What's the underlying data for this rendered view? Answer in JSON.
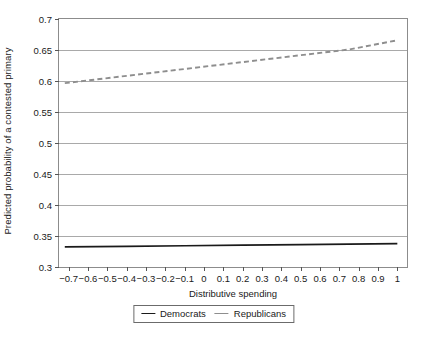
{
  "chart_data": {
    "type": "line",
    "title": "",
    "xlabel": "Distributive spending",
    "ylabel": "Predicted probability of a contested primary",
    "xlim": [
      -0.75,
      1.05
    ],
    "ylim": [
      0.3,
      0.7
    ],
    "xticks": [
      -0.7,
      -0.6,
      -0.5,
      -0.4,
      -0.3,
      -0.2,
      -0.1,
      0,
      0.1,
      0.2,
      0.3,
      0.4,
      0.5,
      0.6,
      0.7,
      0.8,
      0.9,
      1
    ],
    "xticklabels": [
      "−0.7",
      "−0.6",
      "−0.5",
      "−0.4",
      "−0.3",
      "−0.2",
      "−0.1",
      "0",
      "0.1",
      "0.2",
      "0.3",
      "0.4",
      "0.5",
      "0.6",
      "0.7",
      "0.8",
      "0.9",
      "1"
    ],
    "yticks": [
      0.3,
      0.35,
      0.4,
      0.45,
      0.5,
      0.55,
      0.6,
      0.65,
      0.7
    ],
    "yticklabels": [
      "0.3",
      "0.35",
      "0.4",
      "0.45",
      "0.5",
      "0.55",
      "0.6",
      "0.65",
      "0.7"
    ],
    "grid": "horizontal",
    "legend_position": "below-center",
    "series": [
      {
        "name": "Democrats",
        "style": "solid",
        "color": "#1a1a1a",
        "x": [
          -0.72,
          -0.4,
          -0.1,
          0.2,
          0.5,
          0.75,
          1.0
        ],
        "values": [
          0.3325,
          0.3334,
          0.3343,
          0.3352,
          0.3362,
          0.337,
          0.3378
        ]
      },
      {
        "name": "Republicans",
        "style": "dashed",
        "color": "#8e8e8e",
        "x": [
          -0.72,
          -0.4,
          -0.1,
          0.2,
          0.5,
          0.75,
          1.0
        ],
        "values": [
          0.5965,
          0.6083,
          0.6194,
          0.6305,
          0.6416,
          0.6508,
          0.6657
        ]
      }
    ]
  },
  "legend": {
    "entries": [
      {
        "label": "Democrats"
      },
      {
        "label": "Republicans"
      }
    ]
  }
}
